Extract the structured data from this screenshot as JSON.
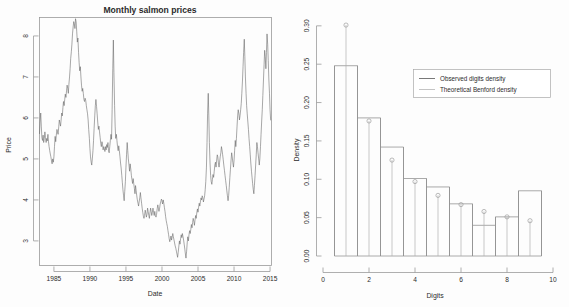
{
  "figure": {
    "panels": [
      "salmon-price-timeseries",
      "benford-digit-histogram"
    ]
  },
  "left_chart": {
    "title": "Monthly salmon prices",
    "xlabel": "Date",
    "ylabel": "Price",
    "xticks": [
      "1985",
      "1990",
      "1995",
      "2000",
      "2005",
      "2010",
      "2015"
    ],
    "yticks": [
      "3",
      "4",
      "5",
      "6",
      "7",
      "8"
    ]
  },
  "right_chart": {
    "xlabel": "Digits",
    "ylabel": "Density",
    "xticks": [
      "0",
      "2",
      "4",
      "6",
      "8",
      "10"
    ],
    "yticks": [
      "0.00",
      "0.05",
      "0.10",
      "0.15",
      "0.20",
      "0.25",
      "0.30"
    ],
    "legend": {
      "observed_label": "Observed digits density",
      "theoretical_label": "Theoretical Benford density"
    }
  },
  "chart_data": [
    {
      "type": "line",
      "name": "salmon-price-timeseries",
      "title": "Monthly salmon prices",
      "xlabel": "Date",
      "ylabel": "Price",
      "xlim": [
        1983.0,
        2015.2
      ],
      "ylim": [
        2.4,
        8.45
      ],
      "xticks": [
        1985,
        1990,
        1995,
        2000,
        2005,
        2010,
        2015
      ],
      "yticks": [
        3,
        4,
        5,
        6,
        7,
        8
      ],
      "grid": false,
      "legend": "none",
      "x": [
        1983.0,
        1983.08,
        1983.17,
        1983.25,
        1983.33,
        1983.42,
        1983.5,
        1983.58,
        1983.67,
        1983.75,
        1983.83,
        1983.92,
        1984.0,
        1984.08,
        1984.17,
        1984.25,
        1984.33,
        1984.42,
        1984.5,
        1984.58,
        1984.67,
        1984.75,
        1984.83,
        1984.92,
        1985.0,
        1985.08,
        1985.17,
        1985.25,
        1985.33,
        1985.42,
        1985.5,
        1985.58,
        1985.67,
        1985.75,
        1985.83,
        1985.92,
        1986.0,
        1986.08,
        1986.17,
        1986.25,
        1986.33,
        1986.42,
        1986.5,
        1986.58,
        1986.67,
        1986.75,
        1986.83,
        1986.92,
        1987.0,
        1987.08,
        1987.17,
        1987.25,
        1987.33,
        1987.42,
        1987.5,
        1987.58,
        1987.67,
        1987.75,
        1987.83,
        1987.92,
        1988.0,
        1988.08,
        1988.17,
        1988.25,
        1988.33,
        1988.42,
        1988.5,
        1988.58,
        1988.67,
        1988.75,
        1988.83,
        1988.92,
        1989.0,
        1989.08,
        1989.17,
        1989.25,
        1989.33,
        1989.42,
        1989.5,
        1989.58,
        1989.67,
        1989.75,
        1989.83,
        1989.92,
        1990.0,
        1990.08,
        1990.17,
        1990.25,
        1990.33,
        1990.42,
        1990.5,
        1990.58,
        1990.67,
        1990.75,
        1990.83,
        1990.92,
        1991.0,
        1991.08,
        1991.17,
        1991.25,
        1991.33,
        1991.42,
        1991.5,
        1991.58,
        1991.67,
        1991.75,
        1991.83,
        1991.92,
        1992.0,
        1992.08,
        1992.17,
        1992.25,
        1992.33,
        1992.42,
        1992.5,
        1992.58,
        1992.67,
        1992.75,
        1992.83,
        1992.92,
        1993.0,
        1993.08,
        1993.17,
        1993.25,
        1993.33,
        1993.42,
        1993.5,
        1993.58,
        1993.67,
        1993.75,
        1993.83,
        1993.92,
        1994.0,
        1994.08,
        1994.17,
        1994.25,
        1994.33,
        1994.42,
        1994.5,
        1994.58,
        1994.67,
        1994.75,
        1994.83,
        1994.92,
        1995.0,
        1995.08,
        1995.17,
        1995.25,
        1995.33,
        1995.42,
        1995.5,
        1995.58,
        1995.67,
        1995.75,
        1995.83,
        1995.92,
        1996.0,
        1996.08,
        1996.17,
        1996.25,
        1996.33,
        1996.42,
        1996.5,
        1996.58,
        1996.67,
        1996.75,
        1996.83,
        1996.92,
        1997.0,
        1997.08,
        1997.17,
        1997.25,
        1997.33,
        1997.42,
        1997.5,
        1997.58,
        1997.67,
        1997.75,
        1997.83,
        1997.92,
        1998.0,
        1998.08,
        1998.17,
        1998.25,
        1998.33,
        1998.42,
        1998.5,
        1998.58,
        1998.67,
        1998.75,
        1998.83,
        1998.92,
        1999.0,
        1999.08,
        1999.17,
        1999.25,
        1999.33,
        1999.42,
        1999.5,
        1999.58,
        1999.67,
        1999.75,
        1999.83,
        1999.92,
        2000.0,
        2000.08,
        2000.17,
        2000.25,
        2000.33,
        2000.42,
        2000.5,
        2000.58,
        2000.67,
        2000.75,
        2000.83,
        2000.92,
        2001.0,
        2001.08,
        2001.17,
        2001.25,
        2001.33,
        2001.42,
        2001.5,
        2001.58,
        2001.67,
        2001.75,
        2001.83,
        2001.92,
        2002.0,
        2002.08,
        2002.17,
        2002.25,
        2002.33,
        2002.42,
        2002.5,
        2002.58,
        2002.67,
        2002.75,
        2002.83,
        2002.92,
        2003.0,
        2003.08,
        2003.17,
        2003.25,
        2003.33,
        2003.42,
        2003.5,
        2003.58,
        2003.67,
        2003.75,
        2003.83,
        2003.92,
        2004.0,
        2004.08,
        2004.17,
        2004.25,
        2004.33,
        2004.42,
        2004.5,
        2004.58,
        2004.67,
        2004.75,
        2004.83,
        2004.92,
        2005.0,
        2005.08,
        2005.17,
        2005.25,
        2005.33,
        2005.42,
        2005.5,
        2005.58,
        2005.67,
        2005.75,
        2005.83,
        2005.92,
        2006.0,
        2006.08,
        2006.17,
        2006.25,
        2006.33,
        2006.42,
        2006.5,
        2006.58,
        2006.67,
        2006.75,
        2006.83,
        2006.92,
        2007.0,
        2007.08,
        2007.17,
        2007.25,
        2007.33,
        2007.42,
        2007.5,
        2007.58,
        2007.67,
        2007.75,
        2007.83,
        2007.92,
        2008.0,
        2008.08,
        2008.17,
        2008.25,
        2008.33,
        2008.42,
        2008.5,
        2008.58,
        2008.67,
        2008.75,
        2008.83,
        2008.92,
        2009.0,
        2009.08,
        2009.17,
        2009.25,
        2009.33,
        2009.42,
        2009.5,
        2009.58,
        2009.67,
        2009.75,
        2009.83,
        2009.92,
        2010.0,
        2010.08,
        2010.17,
        2010.25,
        2010.33,
        2010.42,
        2010.5,
        2010.58,
        2010.67,
        2010.75,
        2010.83,
        2010.92,
        2011.0,
        2011.08,
        2011.17,
        2011.25,
        2011.33,
        2011.42,
        2011.5,
        2011.58,
        2011.67,
        2011.75,
        2011.83,
        2011.92,
        2012.0,
        2012.08,
        2012.17,
        2012.25,
        2012.33,
        2012.42,
        2012.5,
        2012.58,
        2012.67,
        2012.75,
        2012.83,
        2012.92,
        2013.0,
        2013.08,
        2013.17,
        2013.25,
        2013.33,
        2013.42,
        2013.5,
        2013.58,
        2013.67,
        2013.75,
        2013.83,
        2013.92,
        2014.0,
        2014.08,
        2014.17,
        2014.25,
        2014.33,
        2014.42,
        2014.5,
        2014.58,
        2014.67,
        2014.75,
        2014.83,
        2014.92,
        2015.0,
        2015.08
      ],
      "y": [
        5.62,
        5.9,
        6.12,
        5.8,
        5.52,
        5.45,
        5.58,
        5.4,
        5.5,
        5.66,
        5.52,
        5.4,
        5.5,
        5.44,
        5.6,
        5.42,
        5.3,
        5.2,
        5.12,
        5.05,
        4.95,
        4.88,
        5.0,
        4.92,
        5.05,
        5.3,
        5.55,
        5.42,
        5.58,
        5.72,
        5.66,
        5.6,
        5.78,
        5.95,
        5.88,
        5.8,
        5.95,
        6.12,
        6.05,
        6.25,
        6.4,
        6.3,
        6.45,
        6.58,
        6.5,
        6.66,
        6.8,
        6.72,
        6.6,
        6.82,
        7.0,
        7.2,
        7.45,
        7.62,
        7.8,
        8.05,
        8.22,
        8.35,
        8.3,
        8.18,
        8.42,
        8.35,
        8.1,
        7.85,
        7.95,
        7.6,
        7.35,
        7.15,
        7.25,
        7.0,
        6.8,
        6.65,
        6.72,
        6.6,
        6.45,
        6.4,
        6.48,
        6.42,
        6.3,
        6.2,
        6.1,
        5.95,
        5.72,
        5.5,
        5.25,
        5.05,
        4.92,
        4.85,
        5.0,
        5.2,
        5.45,
        5.75,
        6.05,
        6.3,
        6.45,
        6.28,
        6.1,
        5.9,
        5.72,
        5.8,
        5.66,
        5.52,
        5.38,
        5.3,
        5.42,
        5.35,
        5.22,
        5.3,
        5.25,
        5.18,
        5.3,
        5.22,
        5.35,
        5.28,
        5.4,
        5.2,
        5.15,
        5.3,
        5.45,
        5.6,
        5.48,
        6.2,
        7.2,
        7.9,
        7.1,
        6.3,
        5.8,
        5.5,
        5.6,
        5.45,
        5.3,
        5.2,
        5.32,
        5.2,
        5.05,
        4.9,
        4.78,
        4.6,
        4.42,
        4.25,
        4.1,
        3.98,
        4.2,
        4.45,
        4.8,
        5.1,
        5.4,
        5.2,
        5.0,
        4.85,
        4.7,
        4.88,
        4.75,
        4.6,
        4.5,
        4.4,
        4.52,
        4.4,
        4.28,
        4.15,
        4.35,
        4.22,
        4.1,
        4.0,
        3.92,
        3.85,
        3.95,
        4.05,
        4.18,
        4.05,
        3.92,
        3.8,
        3.7,
        3.6,
        3.55,
        3.62,
        3.75,
        3.68,
        3.58,
        3.65,
        3.8,
        3.72,
        3.62,
        3.55,
        3.68,
        3.8,
        3.72,
        3.62,
        3.7,
        3.8,
        3.7,
        3.62,
        3.72,
        3.62,
        3.58,
        3.65,
        3.78,
        3.88,
        3.8,
        3.72,
        3.8,
        3.9,
        3.95,
        4.02,
        3.98,
        3.9,
        4.0,
        3.92,
        3.82,
        3.72,
        3.6,
        3.5,
        3.42,
        3.35,
        3.25,
        3.15,
        3.05,
        2.98,
        3.05,
        3.12,
        3.02,
        3.1,
        3.18,
        3.1,
        3.02,
        2.95,
        2.88,
        2.82,
        2.75,
        2.68,
        2.6,
        2.72,
        2.85,
        3.0,
        2.92,
        3.05,
        3.15,
        3.08,
        3.18,
        3.1,
        3.02,
        2.92,
        2.8,
        2.68,
        2.58,
        2.75,
        2.95,
        3.1,
        3.0,
        3.15,
        3.25,
        3.18,
        3.28,
        3.4,
        3.32,
        3.45,
        3.55,
        3.48,
        3.38,
        3.5,
        3.62,
        3.55,
        3.68,
        3.78,
        3.7,
        3.82,
        3.92,
        3.85,
        3.95,
        4.05,
        4.0,
        4.1,
        4.05,
        3.95,
        4.02,
        4.1,
        4.25,
        4.45,
        4.8,
        5.4,
        6.1,
        6.6,
        6.05,
        5.4,
        4.9,
        4.6,
        4.45,
        4.38,
        4.5,
        4.62,
        4.55,
        4.7,
        4.85,
        4.92,
        4.8,
        4.95,
        5.1,
        5.05,
        4.9,
        4.8,
        4.92,
        5.05,
        5.15,
        5.3,
        5.22,
        5.1,
        4.98,
        4.85,
        4.72,
        4.6,
        4.48,
        4.35,
        4.22,
        4.1,
        3.98,
        4.1,
        4.3,
        4.55,
        4.75,
        4.95,
        5.15,
        5.05,
        4.92,
        4.8,
        4.95,
        5.2,
        5.45,
        5.3,
        5.5,
        5.8,
        6.05,
        6.2,
        6.1,
        5.95,
        6.05,
        6.2,
        6.35,
        6.6,
        6.9,
        7.25,
        7.6,
        7.92,
        7.5,
        7.0,
        6.6,
        6.3,
        6.1,
        5.9,
        5.72,
        5.5,
        5.3,
        5.1,
        4.9,
        4.7,
        4.55,
        4.4,
        4.25,
        4.15,
        4.35,
        4.6,
        4.85,
        5.1,
        5.4,
        5.3,
        5.15,
        5.0,
        4.85,
        5.0,
        5.3,
        5.6,
        5.9,
        6.2,
        6.55,
        6.9,
        7.3,
        7.65,
        7.5,
        7.2,
        7.6,
        8.05,
        7.8,
        7.4,
        6.95,
        6.6,
        6.2,
        5.95,
        5.4,
        5.75,
        6.05,
        6.1
      ]
    },
    {
      "type": "bar",
      "name": "benford-digit-histogram",
      "title": "",
      "xlabel": "Digits",
      "ylabel": "Density",
      "xlim": [
        0,
        10
      ],
      "ylim": [
        0,
        0.305
      ],
      "xticks": [
        0,
        2,
        4,
        6,
        8,
        10
      ],
      "yticks": [
        0.0,
        0.05,
        0.1,
        0.15,
        0.2,
        0.25,
        0.3
      ],
      "grid": false,
      "legend": "upper-right",
      "categories": [
        1,
        2,
        3,
        4,
        5,
        6,
        7,
        8,
        9
      ],
      "series": [
        {
          "name": "Observed digits density",
          "style": "bar",
          "values": [
            0.248,
            0.18,
            0.142,
            0.101,
            0.09,
            0.068,
            0.04,
            0.051,
            0.085
          ]
        },
        {
          "name": "Theoretical Benford density",
          "style": "stem-point",
          "values": [
            0.301,
            0.176,
            0.125,
            0.097,
            0.079,
            0.067,
            0.058,
            0.051,
            0.046
          ]
        }
      ]
    }
  ]
}
